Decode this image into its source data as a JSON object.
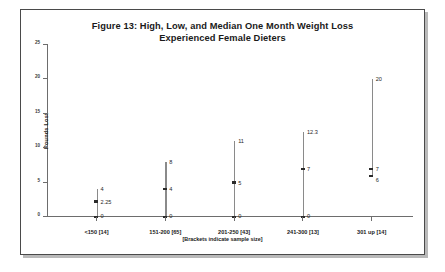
{
  "figure": {
    "title_line1": "Figure 13: High, Low, and Median One Month Weight Loss",
    "title_line2": "Experienced Female Dieters",
    "footnote": "[Brackets indicate sample size]"
  },
  "chart_data": {
    "type": "line",
    "title": "Figure 13: High, Low, and Median One Month Weight Loss Experienced Female Dieters",
    "xlabel": "",
    "ylabel": "Pounds Lost",
    "ylim": [
      0,
      25
    ],
    "yticks": [
      0,
      5,
      10,
      15,
      20,
      25
    ],
    "ytick_labels": [
      "0",
      "5",
      "10",
      "15",
      "20",
      "25"
    ],
    "grid": false,
    "legend": "none",
    "annotation": "[Brackets indicate sample size]",
    "categories": [
      "<150 [14]",
      "151-200 [65]",
      "201-250 [43]",
      "241-300 [13]",
      "301 up [14]"
    ],
    "series": [
      {
        "name": "High",
        "values": [
          4,
          8,
          11,
          12.3,
          20
        ]
      },
      {
        "name": "Median",
        "values": [
          2.25,
          4,
          5,
          7,
          7
        ]
      },
      {
        "name": "Low",
        "values": [
          0,
          0,
          0,
          0,
          6
        ]
      }
    ],
    "points": [
      {
        "category": "<150 [14]",
        "high": 4,
        "high_label": "4",
        "median": 2.25,
        "median_label": "2.25",
        "low": 0,
        "low_label": "0"
      },
      {
        "category": "151-200 [65]",
        "high": 8,
        "high_label": "8",
        "median": 4,
        "median_label": "4",
        "low": 0,
        "low_label": "0"
      },
      {
        "category": "201-250 [43]",
        "high": 11,
        "high_label": "11",
        "median": 5,
        "median_label": "5",
        "low": 0,
        "low_label": "0"
      },
      {
        "category": "241-300 [13]",
        "high": 12.3,
        "high_label": "12.3",
        "median": 7,
        "median_label": "7",
        "low": 0,
        "low_label": "0"
      },
      {
        "category": "301 up [14]",
        "high": 20,
        "high_label": "20",
        "median": 7,
        "median_label": "7",
        "low": 6,
        "low_label": "6"
      }
    ]
  }
}
